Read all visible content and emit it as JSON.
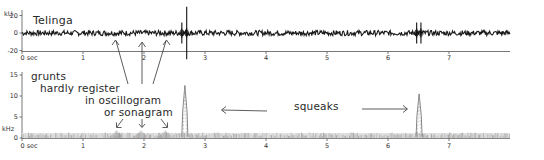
{
  "chart_data": [
    {
      "type": "line",
      "name": "oscillogram",
      "title": "Telinga",
      "ylabel": "kU",
      "xlabel": "sec",
      "xlim": [
        0,
        8
      ],
      "ylim": [
        -30,
        30
      ],
      "x_ticks": [
        0,
        1,
        2,
        3,
        4,
        5,
        6,
        7
      ],
      "x_tick_labels": [
        "0 sec",
        "1",
        "2",
        "3",
        "4",
        "5",
        "6",
        "7"
      ],
      "y_ticks": [
        20,
        0,
        -20
      ],
      "y_tick_labels": [
        "20",
        "0",
        "-20"
      ],
      "baseline_noise_amplitude": 3,
      "events": [
        {
          "label": "squeak",
          "time": 2.62,
          "amplitude": 12
        },
        {
          "label": "squeak",
          "time": 2.7,
          "amplitude": 30
        },
        {
          "label": "squeak",
          "time": 6.47,
          "amplitude": 12
        },
        {
          "label": "squeak",
          "time": 6.54,
          "amplitude": 12
        }
      ]
    },
    {
      "type": "heatmap",
      "name": "sonagram",
      "ylabel": "kHz",
      "xlabel": "sec",
      "xlim": [
        0,
        8
      ],
      "ylim": [
        0,
        16
      ],
      "x_ticks": [
        0,
        1,
        2,
        3,
        4,
        5,
        6,
        7
      ],
      "x_tick_labels": [
        "0 sec",
        "1",
        "2",
        "3",
        "4",
        "5",
        "6",
        "7"
      ],
      "y_ticks": [
        15,
        10,
        5,
        0
      ],
      "y_tick_labels": [
        "15",
        "10",
        "5",
        "0"
      ],
      "noise_band_khz": [
        0,
        1.2
      ],
      "squeaks": [
        {
          "time_start": 2.62,
          "time_end": 2.72,
          "peak_khz": 12.5
        },
        {
          "time_start": 6.46,
          "time_end": 6.56,
          "peak_khz": 10.5
        }
      ],
      "grunt_times": [
        1.55,
        1.95,
        2.35
      ]
    }
  ],
  "annotations": {
    "title": "Telinga",
    "grunts_lines": [
      "grunts",
      "hardly register",
      "in oscillogram",
      "or sonagram"
    ],
    "squeaks": "squeaks"
  },
  "colors": {
    "ink": "#1a1a1a",
    "axis": "#555555",
    "spectro": "#9a9a9a"
  }
}
